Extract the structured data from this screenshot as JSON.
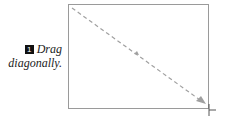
{
  "instruction": {
    "step_number": "1",
    "line1": "Drag",
    "line2": "diagonally."
  },
  "colors": {
    "border": "#9a9a9a",
    "arrow": "#a0a0a0"
  }
}
